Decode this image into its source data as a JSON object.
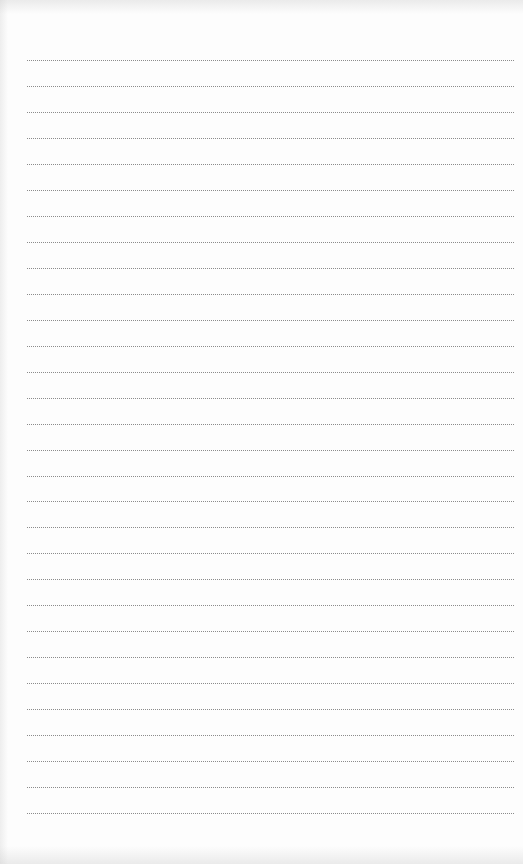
{
  "page": {
    "type": "blank-lined-page",
    "line_style": "dotted",
    "line_count": 30,
    "line_color": "#777777",
    "background_color": "#fdfdfd",
    "first_line_y": 60,
    "line_spacing": 25.97,
    "line_left": 27,
    "line_width": 488
  }
}
